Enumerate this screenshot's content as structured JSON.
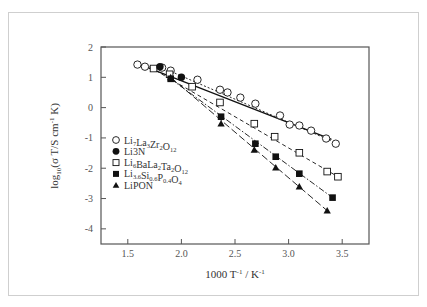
{
  "chart_data": {
    "type": "scatter",
    "title": "",
    "xlabel": "1000 T⁻¹ / K⁻¹",
    "xlabel_parts": {
      "base": "1000 T",
      "sup1": "-1",
      "mid": " / K",
      "sup2": "-1"
    },
    "ylabel": "log₁₀(σT/S cm⁻¹ K)",
    "ylabel_parts": {
      "pre": "log",
      "sub": "10",
      "mid": "(σ T/S cm",
      "sup": "-1",
      "post": " K)"
    },
    "xlim": [
      1.25,
      3.75
    ],
    "ylim": [
      -4.5,
      2
    ],
    "xticks": [
      1.5,
      2.0,
      2.5,
      3.0,
      3.5
    ],
    "xtick_labels": [
      "1.5",
      "2.0",
      "2.5",
      "3.0",
      "3.5"
    ],
    "yticks": [
      2,
      1,
      0,
      -1,
      -2,
      -3,
      -4
    ],
    "ytick_labels": [
      "2",
      "1",
      "0",
      "-1",
      "-2",
      "-3",
      "-4"
    ],
    "grid": false,
    "legend_position": "lower-left inside",
    "series": [
      {
        "name": "Li7La3Zr2O12",
        "label_parts": [
          [
            "Li",
            ""
          ],
          [
            "7",
            "sub"
          ],
          [
            "La",
            ""
          ],
          [
            "3",
            "sub"
          ],
          [
            "Zr",
            ""
          ],
          [
            "2",
            "sub"
          ],
          [
            "O",
            ""
          ],
          [
            "12",
            "sub"
          ]
        ],
        "marker": "open-circle",
        "line": "solid",
        "x": [
          1.59,
          1.66,
          1.82,
          1.9,
          2.15,
          2.36,
          2.43,
          2.55,
          2.69,
          2.92,
          3.01,
          3.1,
          3.21,
          3.35,
          3.44
        ],
        "y": [
          1.42,
          1.35,
          1.32,
          1.22,
          0.92,
          0.59,
          0.5,
          0.33,
          0.13,
          -0.26,
          -0.56,
          -0.59,
          -0.76,
          -1.02,
          -1.19
        ],
        "fit": [
          [
            1.59,
            1.45
          ],
          [
            3.4,
            -1.05
          ]
        ]
      },
      {
        "name": "Li3N",
        "label_parts": [
          [
            "Li3N",
            ""
          ]
        ],
        "marker": "filled-circle",
        "line": "dotted",
        "x": [
          1.8,
          2.0
        ],
        "y": [
          1.35,
          1.0
        ],
        "fit": [
          [
            1.8,
            1.35
          ],
          [
            3.4,
            -1.1
          ]
        ]
      },
      {
        "name": "Li6BaLa2Ta2O12",
        "label_parts": [
          [
            "Li",
            ""
          ],
          [
            "6",
            "sub"
          ],
          [
            "BaLa",
            ""
          ],
          [
            "2",
            "sub"
          ],
          [
            "Ta",
            ""
          ],
          [
            "2",
            "sub"
          ],
          [
            "O",
            ""
          ],
          [
            "12",
            "sub"
          ]
        ],
        "marker": "open-square",
        "line": "dashed",
        "x": [
          1.74,
          1.89,
          2.1,
          2.36,
          2.68,
          2.87,
          3.1,
          3.36,
          3.46
        ],
        "y": [
          1.29,
          1.1,
          0.69,
          0.17,
          -0.53,
          -0.96,
          -1.49,
          -2.11,
          -2.28
        ],
        "fit": [
          [
            1.7,
            1.35
          ],
          [
            3.46,
            -2.28
          ]
        ]
      },
      {
        "name": "Li3.6Si0.6P0.4O4",
        "label_parts": [
          [
            "Li",
            ""
          ],
          [
            "3.6",
            "sub"
          ],
          [
            "Si",
            ""
          ],
          [
            "0.6",
            "sub"
          ],
          [
            "P",
            ""
          ],
          [
            "0.4",
            "sub"
          ],
          [
            "O",
            ""
          ],
          [
            "4",
            "sub"
          ]
        ],
        "marker": "filled-square",
        "line": "dash-dot",
        "x": [
          1.9,
          2.37,
          2.69,
          2.88,
          3.1,
          3.41
        ],
        "y": [
          0.95,
          -0.3,
          -1.19,
          -1.62,
          -2.18,
          -2.97
        ],
        "fit": [
          [
            1.9,
            0.95
          ],
          [
            3.41,
            -2.97
          ]
        ]
      },
      {
        "name": "LiPON",
        "label_parts": [
          [
            "LiPON",
            ""
          ]
        ],
        "marker": "filled-triangle",
        "line": "long-dash",
        "x": [
          1.9,
          2.37,
          2.68,
          2.88,
          3.1,
          3.36
        ],
        "y": [
          1.0,
          -0.53,
          -1.39,
          -1.98,
          -2.61,
          -3.4
        ],
        "fit": [
          [
            1.9,
            1.0
          ],
          [
            3.36,
            -3.4
          ]
        ]
      }
    ]
  },
  "colors": {
    "axis": "#555555",
    "marker": "#111111",
    "card_border": "#cfcfcf",
    "text": "#333333"
  }
}
